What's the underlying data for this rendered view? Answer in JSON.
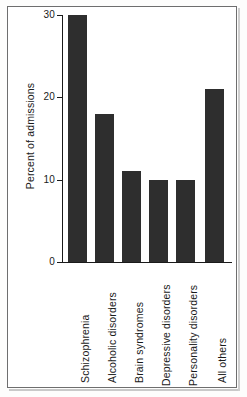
{
  "chart_data": {
    "type": "bar",
    "title": "",
    "subtitle": "",
    "xlabel": "",
    "ylabel": "Percent of admissions",
    "ylim": [
      0,
      30
    ],
    "yticks": [
      "0",
      "10",
      "20",
      "30"
    ],
    "ytick_values": [
      0,
      10,
      20,
      30
    ],
    "grid": false,
    "legend": null,
    "orientation": "vertical",
    "bar_color": "#2e2e2e",
    "categories": [
      "Schizophrenia",
      "Alcoholic disorders",
      "Brain syndromes",
      "Depressive disorders",
      "Personality disorders",
      "All others"
    ],
    "values": [
      30,
      18,
      11,
      10,
      10,
      21
    ],
    "annotations": []
  },
  "figure": {
    "background_color": "#ffffff",
    "frame_color": "#6e6e6e",
    "axis_color": "#1a1a1a"
  }
}
